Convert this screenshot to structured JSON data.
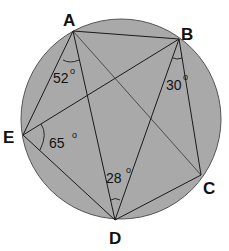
{
  "diagram": {
    "type": "inscribed-pentagon-angles",
    "circle": {
      "cx": 121,
      "cy": 119,
      "r": 100,
      "fill": "#a9a9a9",
      "stroke": "#555555"
    },
    "points": [
      {
        "id": "A",
        "label": "A",
        "x": 73,
        "y": 31,
        "lx": 63,
        "ly": 26
      },
      {
        "id": "B",
        "label": "B",
        "x": 179,
        "y": 39,
        "lx": 181,
        "ly": 40
      },
      {
        "id": "C",
        "label": "C",
        "x": 201,
        "y": 175,
        "lx": 203,
        "ly": 194
      },
      {
        "id": "D",
        "label": "D",
        "x": 115,
        "y": 220,
        "lx": 109,
        "ly": 244
      },
      {
        "id": "E",
        "label": "E",
        "x": 23,
        "y": 135,
        "lx": 4,
        "ly": 143
      }
    ],
    "segments": [
      [
        "A",
        "B"
      ],
      [
        "A",
        "E"
      ],
      [
        "A",
        "D"
      ],
      [
        "A",
        "C"
      ],
      [
        "B",
        "E"
      ],
      [
        "B",
        "D"
      ],
      [
        "B",
        "C"
      ],
      [
        "C",
        "D"
      ],
      [
        "D",
        "E"
      ]
    ],
    "angles": [
      {
        "vertex": "A",
        "between": "E-A-D",
        "value": "52",
        "unit": "o",
        "tx": 53,
        "ty": 82
      },
      {
        "vertex": "B",
        "between": "D-B-C",
        "value": "30",
        "unit": "o",
        "tx": 166,
        "ty": 89
      },
      {
        "vertex": "E",
        "between": "B-E-D",
        "value": "65",
        "unit": "o",
        "tx": 49,
        "ty": 148
      },
      {
        "vertex": "D",
        "between": "A-D-B",
        "value": "28",
        "unit": "o",
        "tx": 106,
        "ty": 182
      }
    ],
    "labels": {
      "A": "A",
      "B": "B",
      "C": "C",
      "D": "D",
      "E": "E",
      "angle_A": "52",
      "angle_B": "30",
      "angle_E": "65",
      "angle_D": "28",
      "degree": "o"
    }
  }
}
